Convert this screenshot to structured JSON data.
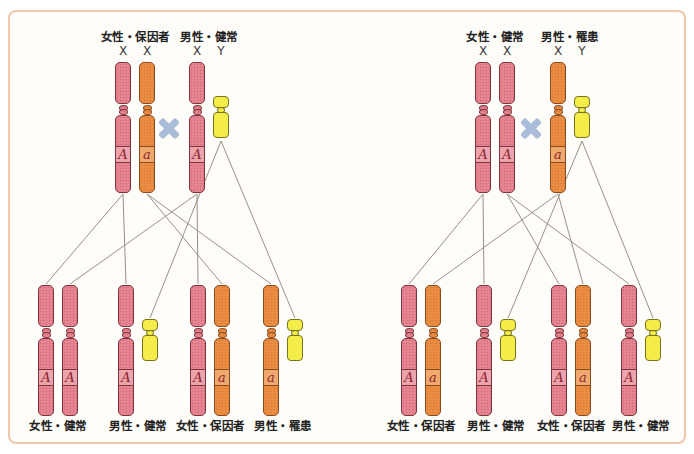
{
  "colors": {
    "x_normal_fill": "#e58490",
    "x_normal_outline": "#7e343a",
    "x_mutant_fill": "#eb8c43",
    "x_mutant_outline": "#8a4a1e",
    "y_fill": "#f4ed49",
    "y_outline": "#78731f",
    "cross_symbol": "#a9bdd8",
    "inheritance_line": "#8f857b",
    "frame_border": "#f2c7ab",
    "allele_text": "#8e1f2f"
  },
  "panels": [
    {
      "id": "left",
      "parents": {
        "mother": {
          "title": "女性・保因者",
          "sex_labels": [
            "X",
            "X"
          ],
          "chromosomes": [
            {
              "kind": "X",
              "fill": "pink",
              "allele": "A"
            },
            {
              "kind": "X",
              "fill": "orange",
              "allele": "a"
            }
          ]
        },
        "father": {
          "title": "男性・健常",
          "sex_labels": [
            "X",
            "Y"
          ],
          "chromosomes": [
            {
              "kind": "X",
              "fill": "pink",
              "allele": "A"
            },
            {
              "kind": "Y"
            }
          ]
        }
      },
      "offspring": [
        {
          "label": "女性・健常",
          "chromosomes": [
            {
              "kind": "X",
              "fill": "pink",
              "allele": "A"
            },
            {
              "kind": "X",
              "fill": "pink",
              "allele": "A"
            }
          ]
        },
        {
          "label": "男性・健常",
          "chromosomes": [
            {
              "kind": "X",
              "fill": "pink",
              "allele": "A"
            },
            {
              "kind": "Y"
            }
          ]
        },
        {
          "label": "女性・保因者",
          "chromosomes": [
            {
              "kind": "X",
              "fill": "pink",
              "allele": "A"
            },
            {
              "kind": "X",
              "fill": "orange",
              "allele": "a"
            }
          ]
        },
        {
          "label": "男性・罹患",
          "chromosomes": [
            {
              "kind": "X",
              "fill": "orange",
              "allele": "a"
            },
            {
              "kind": "Y"
            }
          ]
        }
      ]
    },
    {
      "id": "right",
      "parents": {
        "mother": {
          "title": "女性・健常",
          "sex_labels": [
            "X",
            "X"
          ],
          "chromosomes": [
            {
              "kind": "X",
              "fill": "pink",
              "allele": "A"
            },
            {
              "kind": "X",
              "fill": "pink",
              "allele": "A"
            }
          ]
        },
        "father": {
          "title": "男性・罹患",
          "sex_labels": [
            "X",
            "Y"
          ],
          "chromosomes": [
            {
              "kind": "X",
              "fill": "orange",
              "allele": "a"
            },
            {
              "kind": "Y"
            }
          ]
        }
      },
      "offspring": [
        {
          "label": "女性・保因者",
          "chromosomes": [
            {
              "kind": "X",
              "fill": "pink",
              "allele": "A"
            },
            {
              "kind": "X",
              "fill": "orange",
              "allele": "a"
            }
          ]
        },
        {
          "label": "男性・健常",
          "chromosomes": [
            {
              "kind": "X",
              "fill": "pink",
              "allele": "A"
            },
            {
              "kind": "Y"
            }
          ]
        },
        {
          "label": "女性・保因者",
          "chromosomes": [
            {
              "kind": "X",
              "fill": "pink",
              "allele": "A"
            },
            {
              "kind": "X",
              "fill": "orange",
              "allele": "a"
            }
          ]
        },
        {
          "label": "男性・健常",
          "chromosomes": [
            {
              "kind": "X",
              "fill": "pink",
              "allele": "A"
            },
            {
              "kind": "Y"
            }
          ]
        }
      ]
    }
  ]
}
